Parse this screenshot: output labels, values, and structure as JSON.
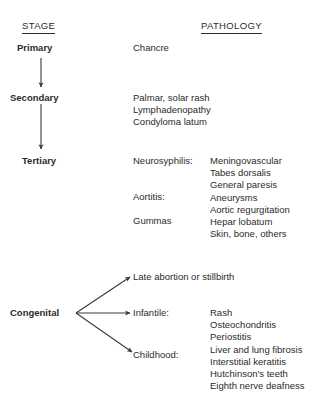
{
  "figure": {
    "title_left": "STAGE",
    "title_right": "PATHOLOGY"
  },
  "stages": [
    {
      "id": "primary",
      "label": "Primary",
      "pathology": [
        "Chancre"
      ]
    },
    {
      "id": "secondary",
      "label": "Secondary",
      "pathology": [
        "Palmar, solar rash",
        "Lymphadenopathy",
        "Condyloma latum"
      ]
    },
    {
      "id": "tertiary",
      "label": "Tertiary",
      "categories": [
        {
          "name": "Neurosyphilis:",
          "findings": [
            "Meningovascular",
            "Tabes dorsalis",
            "General paresis"
          ]
        },
        {
          "name": "Aortitis:",
          "findings": [
            "Aneurysms",
            "Aortic regurgitation"
          ]
        },
        {
          "name": "Gummas",
          "findings": [
            "Hepar lobatum",
            "Skin, bone, others"
          ]
        }
      ]
    }
  ],
  "congenital": {
    "label": "Congenital",
    "branches": [
      {
        "id": "late-abortion",
        "name": "Late abortion or stillbirth",
        "findings": []
      },
      {
        "id": "infantile",
        "name": "Infantile:",
        "findings": [
          "Rash",
          "Osteochondritis",
          "Periostitis",
          "Liver and lung fibrosis"
        ]
      },
      {
        "id": "childhood",
        "name": "Childhood:",
        "findings": [
          "Interstitial keratitis",
          "Hutchinson's teeth",
          "Eighth nerve deafness"
        ]
      }
    ]
  },
  "tertiary_flat": {
    "category_names": [
      "Neurosyphilis:",
      "Aortitis:",
      "Gummas"
    ],
    "findings": [
      "Meningovascular",
      "Tabes dorsalis",
      "General paresis",
      "Aneurysms",
      "Aortic regurgitation",
      "Hepar lobatum",
      "Skin, bone, others"
    ]
  },
  "congenital_flat": {
    "findings": [
      "Rash",
      "Osteochondritis",
      "Periostitis",
      "Liver and lung fibrosis",
      "Interstitial keratitis",
      "Hutchinson's teeth",
      "Eighth nerve deafness"
    ]
  },
  "style": {
    "ink": "#2b2b2b",
    "background": "#ffffff"
  }
}
